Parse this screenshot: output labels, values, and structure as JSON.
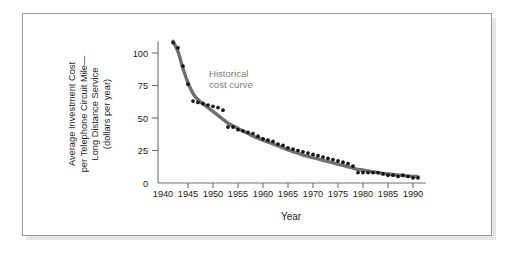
{
  "figure": {
    "frame_color": "#9a9a9a",
    "background": "#ffffff"
  },
  "chart_data": {
    "type": "scatter",
    "title": "",
    "subtitle": "",
    "xlabel": "Year",
    "ylabel": "Average Investment Cost per Telephone Circuit Mile— Long Distance Service (dollars per year)",
    "ylabel_lines": [
      "Average Investment Cost",
      "per Telephone Circuit Mile—",
      "Long Distance Service",
      "(dollars per year)"
    ],
    "xlim": [
      1940,
      1992
    ],
    "ylim": [
      0,
      115
    ],
    "xticks": [
      1940,
      1945,
      1950,
      1955,
      1960,
      1965,
      1970,
      1975,
      1980,
      1985,
      1990
    ],
    "xtick_labels": [
      "1940",
      "1945",
      "1950",
      "1955",
      "1960",
      "1965",
      "1970",
      "1975",
      "1980",
      "1985",
      "1990"
    ],
    "yticks": [
      0,
      25,
      50,
      75,
      100
    ],
    "ytick_labels": [
      "0",
      "25",
      "50",
      "75",
      "100"
    ],
    "grid": false,
    "legend": null,
    "annotations": [
      {
        "name": "historical-cost-curve-label",
        "text": "Historical cost curve",
        "lines": [
          "Historical",
          "cost curve"
        ],
        "x": 1949.0,
        "y": 88,
        "color": "#7d7d7d"
      }
    ],
    "series": [
      {
        "name": "Average investment cost (data points)",
        "marker": "dot",
        "marker_color": "#111111",
        "x": [
          1942,
          1943,
          1944,
          1945,
          1946,
          1947,
          1948,
          1949,
          1950,
          1951,
          1952,
          1953,
          1954,
          1955,
          1956,
          1957,
          1958,
          1959,
          1960,
          1961,
          1962,
          1963,
          1964,
          1965,
          1966,
          1967,
          1968,
          1969,
          1970,
          1971,
          1972,
          1973,
          1974,
          1975,
          1976,
          1977,
          1978,
          1979,
          1980,
          1981,
          1982,
          1983,
          1984,
          1985,
          1986,
          1987,
          1988,
          1989,
          1990,
          1991
        ],
        "values": [
          108,
          104,
          90,
          76,
          63,
          62,
          61,
          60,
          59,
          58,
          56,
          43,
          43,
          41,
          40,
          39,
          38,
          36,
          34,
          33,
          32,
          30,
          29,
          27,
          26,
          25,
          24,
          23,
          22,
          21,
          20,
          19,
          18,
          17,
          16,
          15,
          13,
          8,
          8,
          8,
          8,
          8,
          7,
          6,
          6,
          5,
          6,
          5,
          4,
          4
        ]
      },
      {
        "name": "Historical cost curve (fitted)",
        "marker": "none",
        "line_color": "#6f6f6f",
        "line_width": 3.4,
        "x": [
          1942,
          1943,
          1944,
          1945,
          1946,
          1947,
          1948,
          1949,
          1950,
          1951,
          1952,
          1953,
          1954,
          1955,
          1956,
          1957,
          1958,
          1959,
          1960,
          1961,
          1962,
          1963,
          1964,
          1965,
          1966,
          1967,
          1968,
          1969,
          1970,
          1971,
          1972,
          1973,
          1974,
          1975,
          1976,
          1977,
          1978,
          1979,
          1980,
          1981,
          1982,
          1983,
          1984,
          1985,
          1986,
          1987,
          1988,
          1989,
          1990,
          1991
        ],
        "values": [
          109,
          101,
          88,
          77,
          69,
          64,
          61,
          58,
          55,
          52,
          49,
          46,
          44,
          42,
          40,
          38,
          36,
          34.5,
          33,
          31.5,
          30,
          28.5,
          27,
          25.5,
          24,
          23,
          21.5,
          20.5,
          19.5,
          18.5,
          17.5,
          16.5,
          15.5,
          14.5,
          13.5,
          12.5,
          11.5,
          10.5,
          10,
          9.2,
          8.6,
          8.0,
          7.4,
          7.0,
          6.5,
          6.1,
          5.7,
          5.4,
          5.1,
          4.8
        ]
      }
    ]
  }
}
